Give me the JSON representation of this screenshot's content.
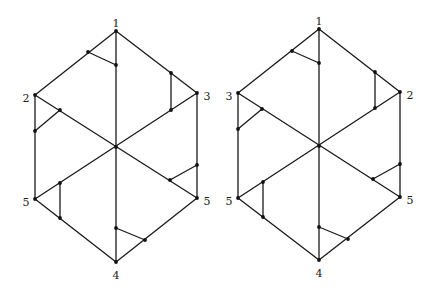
{
  "figure": {
    "line_color": "#1a1a1a",
    "background": "#ffffff"
  },
  "diagrams": [
    {
      "id": "left",
      "center": [
        116,
        147
      ],
      "vertices": {
        "top": {
          "xy": [
            116,
            31
          ],
          "label": "1",
          "label_xy": [
            116,
            24
          ]
        },
        "upper_left": {
          "xy": [
            35,
            95
          ],
          "label": "2",
          "label_xy": [
            26,
            99
          ]
        },
        "upper_right": {
          "xy": [
            197,
            93
          ],
          "label": "3",
          "label_xy": [
            207,
            97
          ]
        },
        "lower_left": {
          "xy": [
            35,
            199
          ],
          "label": "5",
          "label_xy": [
            26,
            203
          ]
        },
        "lower_right": {
          "xy": [
            197,
            198
          ],
          "label": "5",
          "label_xy": [
            207,
            202
          ]
        },
        "bottom": {
          "xy": [
            116,
            262
          ],
          "label": "4",
          "label_xy": [
            116,
            276
          ]
        }
      },
      "gadgets": [
        {
          "a": [
            88,
            52
          ],
          "b": [
            116,
            65
          ]
        },
        {
          "a": [
            171,
            73
          ],
          "b": [
            171,
            110
          ]
        },
        {
          "a": [
            60,
            110
          ],
          "b": [
            35,
            131
          ]
        },
        {
          "a": [
            60,
            183
          ],
          "b": [
            60,
            218
          ]
        },
        {
          "a": [
            170,
            180
          ],
          "b": [
            197,
            165
          ]
        },
        {
          "a": [
            116,
            228
          ],
          "b": [
            145,
            240
          ]
        }
      ]
    },
    {
      "id": "right",
      "center": [
        319,
        146
      ],
      "vertices": {
        "top": {
          "xy": [
            319,
            29
          ],
          "label": "1",
          "label_xy": [
            319,
            22
          ]
        },
        "upper_left": {
          "xy": [
            238,
            93
          ],
          "label": "3",
          "label_xy": [
            229,
            97
          ]
        },
        "upper_right": {
          "xy": [
            400,
            92
          ],
          "label": "2",
          "label_xy": [
            410,
            96
          ]
        },
        "lower_left": {
          "xy": [
            238,
            198
          ],
          "label": "5",
          "label_xy": [
            229,
            202
          ]
        },
        "lower_right": {
          "xy": [
            400,
            197
          ],
          "label": "5",
          "label_xy": [
            410,
            201
          ]
        },
        "bottom": {
          "xy": [
            319,
            260
          ],
          "label": "4",
          "label_xy": [
            319,
            274
          ]
        }
      },
      "gadgets": [
        {
          "a": [
            292,
            51
          ],
          "b": [
            319,
            63
          ]
        },
        {
          "a": [
            375,
            72
          ],
          "b": [
            375,
            108
          ]
        },
        {
          "a": [
            262,
            109
          ],
          "b": [
            238,
            129
          ]
        },
        {
          "a": [
            263,
            182
          ],
          "b": [
            263,
            217
          ]
        },
        {
          "a": [
            373,
            179
          ],
          "b": [
            400,
            164
          ]
        },
        {
          "a": [
            319,
            227
          ],
          "b": [
            348,
            239
          ]
        }
      ]
    }
  ],
  "labels": {
    "left": {
      "top": "1",
      "upper_left": "2",
      "upper_right": "3",
      "lower_left": "5",
      "lower_right": "5",
      "bottom": "4"
    },
    "right": {
      "top": "1",
      "upper_left": "3",
      "upper_right": "2",
      "lower_left": "5",
      "lower_right": "5",
      "bottom": "4"
    }
  }
}
